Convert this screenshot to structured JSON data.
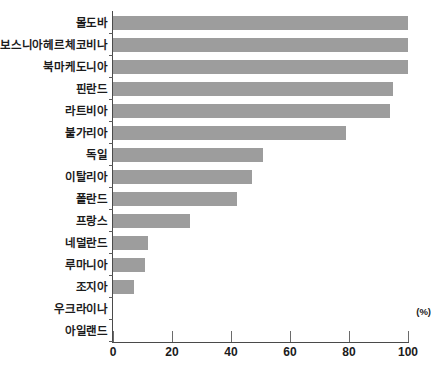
{
  "chart_data": {
    "type": "bar",
    "orientation": "horizontal",
    "title": "",
    "xlabel": "(%)",
    "ylabel": "",
    "xlim": [
      0,
      100
    ],
    "xticks": [
      0,
      20,
      40,
      60,
      80,
      100
    ],
    "grid": false,
    "legend": null,
    "bar_color": "#9d9d9d",
    "categories": [
      "몰도바",
      "보스니아헤르체코비나",
      "북마케도니아",
      "핀란드",
      "라트비아",
      "불가리아",
      "독일",
      "이탈리아",
      "폴란드",
      "프랑스",
      "네덜란드",
      "루마니아",
      "조지아",
      "우크라이나",
      "아일랜드"
    ],
    "values": [
      100,
      100,
      100,
      95,
      94,
      79,
      51,
      47,
      42,
      26,
      12,
      11,
      7,
      0,
      0
    ],
    "series": [
      {
        "name": "",
        "values": [
          100,
          100,
          100,
          95,
          94,
          79,
          51,
          47,
          42,
          26,
          12,
          11,
          7,
          0,
          0
        ]
      }
    ]
  },
  "axis": {
    "unit_label": "(%)",
    "tick_labels": [
      "0",
      "20",
      "40",
      "60",
      "80",
      "100"
    ]
  },
  "title_sliver": "· · · · · · · · · · · · · · · · · · · ·"
}
